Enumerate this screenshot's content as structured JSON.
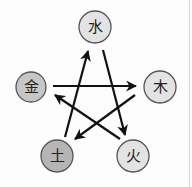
{
  "diagram": {
    "nodes": [
      {
        "id": "water",
        "label": "水",
        "cx": 95,
        "cy": 27,
        "r": 16,
        "fill": "#e3e3e3"
      },
      {
        "id": "wood",
        "label": "木",
        "cx": 160,
        "cy": 87,
        "r": 16,
        "fill": "#e3e3e3"
      },
      {
        "id": "fire",
        "label": "火",
        "cx": 133,
        "cy": 156,
        "r": 16,
        "fill": "#e3e3e3"
      },
      {
        "id": "earth",
        "label": "土",
        "cx": 57,
        "cy": 156,
        "r": 16,
        "fill": "#b5b5b5"
      },
      {
        "id": "metal",
        "label": "金",
        "cx": 31,
        "cy": 87,
        "r": 15,
        "fill": "#c6c6c6"
      }
    ],
    "edges": [
      {
        "from": "metal",
        "to": "wood",
        "x1": 53,
        "y1": 86,
        "x2": 136,
        "y2": 86
      },
      {
        "from": "wood",
        "to": "earth",
        "x1": 135,
        "y1": 95,
        "x2": 75,
        "y2": 139
      },
      {
        "from": "earth",
        "to": "water",
        "x1": 65,
        "y1": 137,
        "x2": 88,
        "y2": 51
      },
      {
        "from": "water",
        "to": "fire",
        "x1": 103,
        "y1": 50,
        "x2": 125,
        "y2": 135
      },
      {
        "from": "fire",
        "to": "metal",
        "x1": 120,
        "y1": 139,
        "x2": 55,
        "y2": 95
      }
    ],
    "colors": {
      "stroke": "#555555",
      "arrow": "#111111"
    }
  }
}
